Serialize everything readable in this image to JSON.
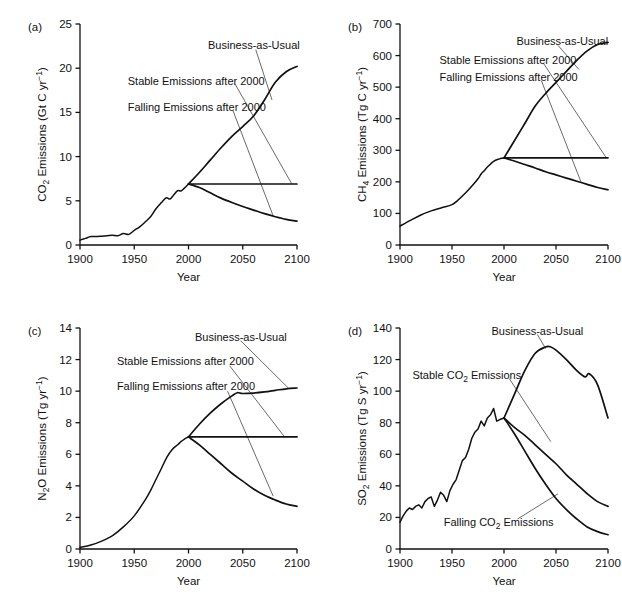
{
  "figure": {
    "title": "",
    "panel_count": 4
  },
  "chart_data": [
    {
      "type": "line",
      "panel": "(a)",
      "title": "",
      "xlabel": "Year",
      "ylabel": "CO2 Emissions (Gt C yr-1)",
      "ylabel_parts": {
        "base": "CO",
        "sub": "2",
        "rest": " Emissions (Gt C yr",
        "sup": "−1",
        "tail": ")"
      },
      "xlim": [
        1900,
        2100
      ],
      "ylim": [
        0,
        25
      ],
      "xticks": [
        1900,
        1950,
        2000,
        2050,
        2100
      ],
      "yticks": [
        0,
        5,
        10,
        15,
        20,
        25
      ],
      "grid": false,
      "legend_position": "inline-annotations",
      "annotations": [
        {
          "label": "Business-as-Usual",
          "x": 2018,
          "y": 22.6
        },
        {
          "label": "Stable Emissions after 2000",
          "x": 1944,
          "y": 18.6
        },
        {
          "label": "Falling Emissions after 2000",
          "x": 1944,
          "y": 15.6
        }
      ],
      "series": [
        {
          "name": "Historical",
          "x": [
            1900,
            1905,
            1910,
            1915,
            1920,
            1925,
            1930,
            1935,
            1940,
            1945,
            1950,
            1955,
            1960,
            1965,
            1970,
            1975,
            1978,
            1980,
            1983,
            1986,
            1990,
            1993,
            1996,
            2000
          ],
          "values": [
            0.55,
            0.75,
            0.95,
            0.95,
            1.0,
            1.05,
            1.1,
            1.05,
            1.3,
            1.2,
            1.65,
            2.05,
            2.6,
            3.2,
            4.1,
            4.8,
            5.2,
            5.35,
            5.2,
            5.6,
            6.15,
            6.1,
            6.4,
            6.9
          ]
        },
        {
          "name": "Business-as-Usual",
          "x": [
            2000,
            2010,
            2020,
            2030,
            2040,
            2050,
            2060,
            2070,
            2080,
            2090,
            2100
          ],
          "values": [
            6.9,
            8.2,
            9.6,
            11.0,
            12.3,
            13.4,
            14.6,
            16.4,
            18.4,
            19.6,
            20.2
          ]
        },
        {
          "name": "Stable Emissions after 2000",
          "x": [
            2000,
            2100
          ],
          "values": [
            6.9,
            6.9
          ]
        },
        {
          "name": "Falling Emissions after 2000",
          "x": [
            2000,
            2010,
            2020,
            2030,
            2040,
            2050,
            2060,
            2070,
            2080,
            2090,
            2100
          ],
          "values": [
            6.9,
            6.5,
            5.9,
            5.3,
            4.8,
            4.35,
            3.95,
            3.55,
            3.2,
            2.9,
            2.7
          ]
        }
      ]
    },
    {
      "type": "line",
      "panel": "(b)",
      "title": "",
      "xlabel": "Year",
      "ylabel": "CH4 Emissions (Tg C yr-1)",
      "ylabel_parts": {
        "base": "CH",
        "sub": "4",
        "rest": " Emissions (Tg C yr",
        "sup": "−1",
        "tail": ")"
      },
      "xlim": [
        1900,
        2100
      ],
      "ylim": [
        0,
        700
      ],
      "xticks": [
        1900,
        1950,
        2000,
        2050,
        2100
      ],
      "yticks": [
        0,
        100,
        200,
        300,
        400,
        500,
        600,
        700
      ],
      "grid": false,
      "legend_position": "inline-annotations",
      "annotations": [
        {
          "label": "Business-as-Usual",
          "x": 2012,
          "y": 645
        },
        {
          "label": "Stable Emissions after 2000",
          "x": 1938,
          "y": 587
        },
        {
          "label": "Falling Emissions after 2000",
          "x": 1938,
          "y": 533
        }
      ],
      "series": [
        {
          "name": "Historical",
          "x": [
            1900,
            1910,
            1920,
            1930,
            1940,
            1950,
            1955,
            1960,
            1965,
            1970,
            1975,
            1978,
            1980,
            1985,
            1990,
            1995,
            2000
          ],
          "values": [
            60,
            78,
            95,
            108,
            118,
            128,
            140,
            155,
            172,
            190,
            210,
            225,
            232,
            250,
            265,
            272,
            276
          ]
        },
        {
          "name": "Business-as-Usual",
          "x": [
            2000,
            2010,
            2020,
            2030,
            2040,
            2050,
            2060,
            2070,
            2080,
            2090,
            2100
          ],
          "values": [
            276,
            330,
            385,
            440,
            480,
            515,
            550,
            585,
            615,
            635,
            642
          ]
        },
        {
          "name": "Stable Emissions after 2000",
          "x": [
            2000,
            2100
          ],
          "values": [
            276,
            276
          ]
        },
        {
          "name": "Falling Emissions after 2000",
          "x": [
            2000,
            2010,
            2020,
            2030,
            2040,
            2050,
            2060,
            2070,
            2080,
            2090,
            2100
          ],
          "values": [
            276,
            266,
            255,
            244,
            232,
            222,
            212,
            202,
            192,
            182,
            175
          ]
        }
      ]
    },
    {
      "type": "line",
      "panel": "(c)",
      "title": "",
      "xlabel": "Year",
      "ylabel": "N2O Emissions (Tg yr-1)",
      "ylabel_parts": {
        "base": "N",
        "sub": "2",
        "rest": "O Emissions (Tg yr",
        "sup": "−1",
        "tail": ")"
      },
      "xlim": [
        1900,
        2100
      ],
      "ylim": [
        0,
        14
      ],
      "xticks": [
        1900,
        1950,
        2000,
        2050,
        2100
      ],
      "yticks": [
        0,
        2,
        4,
        6,
        8,
        10,
        12,
        14
      ],
      "grid": false,
      "legend_position": "inline-annotations",
      "annotations": [
        {
          "label": "Business-as-Usual",
          "x": 2006,
          "y": 13.4
        },
        {
          "label": "Stable Emissions after 2000",
          "x": 1934,
          "y": 11.9
        },
        {
          "label": "Falling Emissions after 2000",
          "x": 1934,
          "y": 10.3
        }
      ],
      "series": [
        {
          "name": "Historical",
          "x": [
            1900,
            1910,
            1920,
            1930,
            1940,
            1950,
            1960,
            1965,
            1970,
            1975,
            1980,
            1985,
            1990,
            1993,
            1996,
            2000
          ],
          "values": [
            0.1,
            0.25,
            0.5,
            0.85,
            1.4,
            2.1,
            3.1,
            3.7,
            4.4,
            5.1,
            5.8,
            6.3,
            6.6,
            6.8,
            6.95,
            7.1
          ]
        },
        {
          "name": "Business-as-Usual",
          "x": [
            2000,
            2010,
            2020,
            2030,
            2040,
            2045,
            2050,
            2060,
            2070,
            2080,
            2090,
            2100
          ],
          "values": [
            7.1,
            7.9,
            8.6,
            9.2,
            9.7,
            9.9,
            9.85,
            9.88,
            9.95,
            10.05,
            10.15,
            10.2
          ]
        },
        {
          "name": "Stable Emissions after 2000",
          "x": [
            2000,
            2100
          ],
          "values": [
            7.1,
            7.1
          ]
        },
        {
          "name": "Falling Emissions after 2000",
          "x": [
            2000,
            2010,
            2020,
            2030,
            2040,
            2050,
            2060,
            2070,
            2080,
            2090,
            2100
          ],
          "values": [
            7.1,
            6.6,
            6.0,
            5.4,
            4.8,
            4.3,
            3.8,
            3.4,
            3.1,
            2.85,
            2.7
          ]
        }
      ]
    },
    {
      "type": "line",
      "panel": "(d)",
      "title": "",
      "xlabel": "Year",
      "ylabel": "SO2 Emissions (Tg S yr-1)",
      "ylabel_parts": {
        "base": "SO",
        "sub": "2",
        "rest": " Emissions (Tg S yr",
        "sup": "−1",
        "tail": ")"
      },
      "xlim": [
        1900,
        2100
      ],
      "ylim": [
        0,
        140
      ],
      "xticks": [
        1900,
        1950,
        2000,
        2050,
        2100
      ],
      "yticks": [
        0,
        20,
        40,
        60,
        80,
        100,
        120,
        140
      ],
      "grid": false,
      "legend_position": "inline-annotations",
      "annotations": [
        {
          "label": "Business-as-Usual",
          "x": 1988,
          "y": 138
        },
        {
          "label": "Stable CO2 Emissions",
          "x": 1912,
          "y": 110
        },
        {
          "label": "Falling CO2 Emissions",
          "x": 1942,
          "y": 17
        }
      ],
      "series": [
        {
          "name": "Historical",
          "x": [
            1900,
            1903,
            1906,
            1909,
            1912,
            1915,
            1918,
            1921,
            1924,
            1927,
            1930,
            1933,
            1936,
            1939,
            1942,
            1945,
            1948,
            1951,
            1954,
            1957,
            1960,
            1963,
            1966,
            1969,
            1972,
            1975,
            1978,
            1981,
            1984,
            1987,
            1990,
            1993,
            1996,
            2000
          ],
          "values": [
            17,
            21,
            24,
            26,
            25,
            27,
            28,
            26,
            30,
            32,
            33,
            27,
            31,
            36,
            34,
            30,
            37,
            41,
            44,
            50,
            56,
            58,
            63,
            70,
            74,
            76,
            81,
            78,
            83,
            85,
            89,
            81,
            82,
            83
          ]
        },
        {
          "name": "Business-as-Usual",
          "x": [
            2000,
            2010,
            2020,
            2030,
            2040,
            2045,
            2050,
            2060,
            2070,
            2078,
            2082,
            2090,
            2100
          ],
          "values": [
            83,
            98,
            113,
            124,
            128,
            128,
            126,
            120,
            113,
            109,
            111,
            104,
            83
          ]
        },
        {
          "name": "Stable CO2 Emissions",
          "x": [
            2000,
            2010,
            2020,
            2030,
            2040,
            2050,
            2060,
            2070,
            2080,
            2090,
            2100
          ],
          "values": [
            83,
            77,
            72,
            66,
            60,
            54,
            47,
            41,
            35,
            30,
            27
          ]
        },
        {
          "name": "Falling CO2 Emissions",
          "x": [
            2000,
            2010,
            2020,
            2030,
            2040,
            2050,
            2060,
            2070,
            2080,
            2090,
            2100
          ],
          "values": [
            83,
            73,
            62,
            51,
            41,
            32,
            25,
            19,
            14,
            11,
            9
          ]
        }
      ]
    }
  ]
}
